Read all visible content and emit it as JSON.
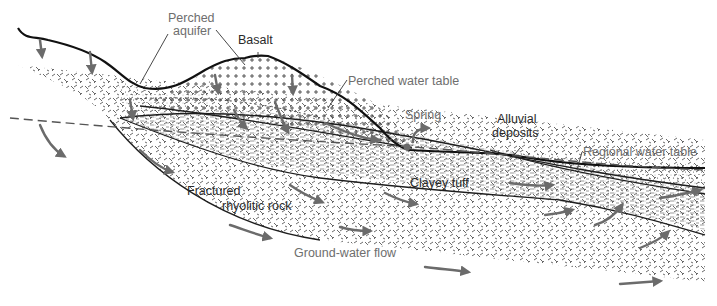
{
  "diagram": {
    "labels": {
      "perched_aquifer_line1": "Perched",
      "perched_aquifer_line2": "aquifer",
      "basalt": "Basalt",
      "perched_water_table": "Perched water table",
      "spring": "Spring",
      "alluvial_line1": "Alluvial",
      "alluvial_line2": "deposits",
      "regional_water_table": "Regional water table",
      "clayey_tuff": "Clayey tuff",
      "fractured_line1": "Fractured",
      "fractured_line2": "rhyolitic rock",
      "groundwater_flow": "Ground-water flow"
    },
    "units": [
      {
        "name": "Basalt",
        "pattern": "crosses"
      },
      {
        "name": "Clayey tuff",
        "pattern": "fine-dashes"
      },
      {
        "name": "Alluvial deposits",
        "pattern": "stipple"
      },
      {
        "name": "Fractured rhyolitic rock",
        "pattern": "random-ticks"
      },
      {
        "name": "Perched aquifer",
        "pattern": "stipple"
      }
    ],
    "colors": {
      "ink": "#1e1e1e",
      "arrow": "#6b6b6b",
      "label_gray": "#6e6e6e",
      "background": "#ffffff"
    }
  }
}
